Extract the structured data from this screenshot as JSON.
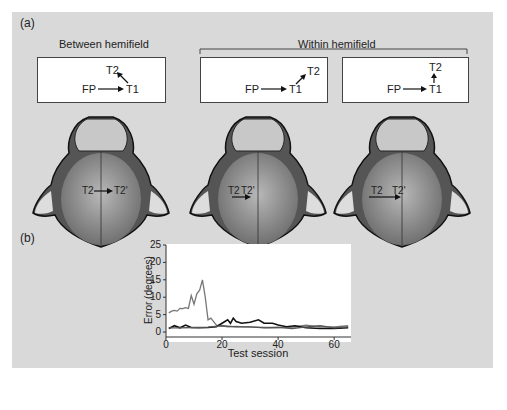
{
  "panel_a": {
    "label": "(a)",
    "between_title": "Between hemifield",
    "within_title": "Within hemifield",
    "boxes": [
      {
        "fp": "FP",
        "t1": "T1",
        "t2": "T2"
      },
      {
        "fp": "FP",
        "t1": "T1",
        "t2": "T2"
      },
      {
        "fp": "FP",
        "t1": "T1",
        "t2": "T2"
      }
    ],
    "heads": [
      {
        "a": "T2",
        "b": "T2'"
      },
      {
        "a": "T2",
        "b": "T2'"
      },
      {
        "a": "T2",
        "b": "T2'"
      }
    ]
  },
  "panel_b": {
    "label": "(b)"
  },
  "chart_data": {
    "type": "line",
    "title": "",
    "xlabel": "Test session",
    "ylabel": "Error (degrees)",
    "xlim": [
      0,
      66
    ],
    "ylim": [
      0,
      25
    ],
    "xticks": [
      0,
      20,
      40,
      60
    ],
    "yticks": [
      0,
      5,
      10,
      15,
      20,
      25
    ],
    "series": [
      {
        "name": "between hemifield (gray, early peak)",
        "color": "#777777",
        "x": [
          1,
          2,
          3,
          4,
          5,
          6,
          7,
          8,
          9,
          10,
          11,
          12,
          13,
          14,
          15,
          16,
          17,
          18,
          20,
          22,
          25,
          28,
          32,
          36,
          40,
          45,
          50,
          55,
          60,
          65
        ],
        "y": [
          5.5,
          6,
          6.2,
          6,
          6.8,
          6.7,
          7,
          6.8,
          10.5,
          8,
          11,
          12,
          15,
          10,
          3.5,
          4,
          3,
          2,
          1.8,
          1.5,
          1.6,
          1.5,
          1.4,
          1.3,
          1.3,
          1.4,
          2,
          1.5,
          1.5,
          1.8
        ]
      },
      {
        "name": "within hemifield A (black)",
        "color": "#111111",
        "x": [
          1,
          3,
          5,
          7,
          9,
          12,
          15,
          18,
          20,
          22,
          23,
          24,
          25,
          27,
          30,
          33,
          35,
          38,
          40,
          43,
          46,
          50,
          55,
          60,
          65
        ],
        "y": [
          1,
          1.8,
          1.2,
          2,
          1.3,
          1.2,
          1.3,
          1.5,
          2.5,
          3.5,
          2.5,
          4,
          3,
          2.5,
          2.8,
          3.5,
          2.5,
          2.5,
          2,
          1.5,
          1.8,
          1.2,
          1,
          1,
          1.2
        ]
      },
      {
        "name": "within hemifield B (mid gray)",
        "color": "#555555",
        "x": [
          1,
          5,
          10,
          15,
          20,
          25,
          30,
          35,
          40,
          45,
          50,
          55,
          60,
          65
        ],
        "y": [
          1.2,
          1.2,
          1.3,
          1.4,
          1.8,
          1.5,
          1.5,
          1.2,
          1.3,
          1,
          1.5,
          1.8,
          1.2,
          1.5
        ]
      }
    ]
  }
}
